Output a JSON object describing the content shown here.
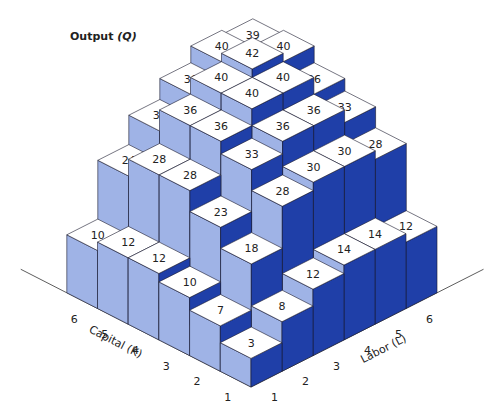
{
  "chart_data": {
    "type": "bar3d",
    "title": "Output (Q)",
    "xlabel": "Capital (K)",
    "ylabel": "Labor (L)",
    "zlabel": "Output (Q)",
    "capital_ticks": [
      "1",
      "2",
      "3",
      "4",
      "5",
      "6"
    ],
    "labor_ticks": [
      "1",
      "2",
      "3",
      "4",
      "5",
      "6"
    ],
    "grid": false,
    "rows_by_capital": [
      {
        "K": 1,
        "values": [
          3,
          8,
          12,
          14,
          14,
          12
        ]
      },
      {
        "K": 2,
        "values": [
          7,
          18,
          28,
          30,
          30,
          28
        ]
      },
      {
        "K": 3,
        "values": [
          10,
          23,
          33,
          36,
          36,
          33
        ]
      },
      {
        "K": 4,
        "values": [
          12,
          28,
          36,
          40,
          40,
          36
        ]
      },
      {
        "K": 5,
        "values": [
          12,
          28,
          36,
          40,
          42,
          40
        ]
      },
      {
        "K": 6,
        "values": [
          10,
          24,
          31,
          36,
          40,
          39
        ]
      }
    ],
    "colors": {
      "top": "#ffffff",
      "capital_face": "#9fb3e6",
      "labor_face": "#1f3fa8",
      "edge": "#1a1a2e"
    }
  },
  "labels": {
    "output_title": "Output",
    "output_symbol": "(Q)"
  }
}
